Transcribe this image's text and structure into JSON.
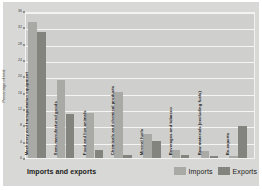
{
  "chart_data": {
    "type": "bar",
    "title": "Imports and exports",
    "xlabel": "",
    "ylabel": "Percentage of total",
    "ylim": [
      0,
      36
    ],
    "ytick_step": 4,
    "yticks": [
      0,
      4,
      8,
      12,
      16,
      20,
      24,
      28,
      32,
      36
    ],
    "ytick_labels": [
      "0",
      "4",
      "8",
      "12",
      "16",
      "20",
      "24",
      "28",
      "32",
      "36"
    ],
    "grid": true,
    "grid_axis": "y",
    "legend_position": "bottom-right",
    "categories": [
      "Machinery and transportation equipment",
      "Semi-manufactured goods",
      "Food and live animals",
      "Chemicals and chemical products",
      "Mineral fuels",
      "Beverages and tobacco",
      "Raw materials (excluding fuels)",
      "Re-exports"
    ],
    "series": [
      {
        "name": "Imports",
        "color": "#a9a9a5",
        "values": [
          33.2,
          19.0,
          11.0,
          16.2,
          6.0,
          2.0,
          1.6,
          0.4
        ]
      },
      {
        "name": "Exports",
        "color": "#84847f",
        "values": [
          30.8,
          10.8,
          2.0,
          0.8,
          4.2,
          0.8,
          0.5,
          7.8
        ]
      }
    ]
  },
  "legend": {
    "entries": [
      {
        "label": "Imports",
        "swatch": "imports-swatch"
      },
      {
        "label": "Exports",
        "swatch": "exports-swatch"
      }
    ]
  },
  "footer": {
    "title": "Imports and exports"
  }
}
